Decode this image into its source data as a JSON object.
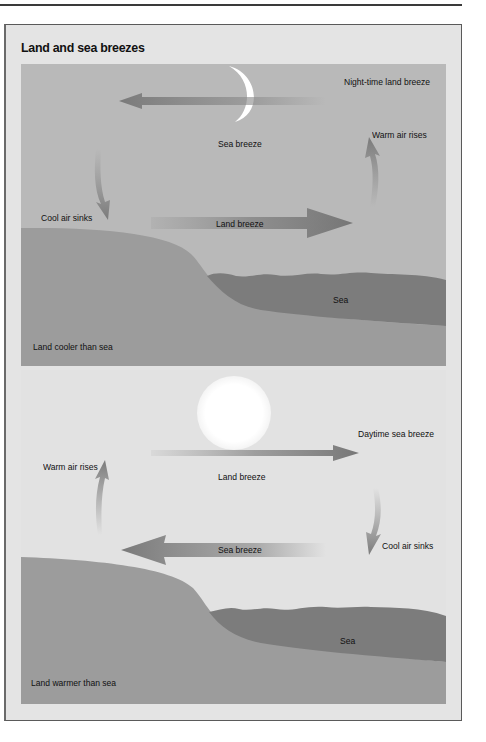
{
  "figure": {
    "title": "Land and sea breezes"
  },
  "night_panel": {
    "caption": "Night-time land breeze",
    "celestial_icon": "crescent-moon-icon",
    "labels": {
      "upper_arrow": "Sea breeze",
      "lower_arrow": "Land breeze",
      "right_vertical": "Warm air rises",
      "left_vertical": "Cool air sinks",
      "sea": "Sea",
      "land": "Land cooler than sea"
    }
  },
  "day_panel": {
    "caption": "Daytime sea breeze",
    "celestial_icon": "sun-icon",
    "labels": {
      "upper_arrow": "Land breeze",
      "lower_arrow": "Sea breeze",
      "left_vertical": "Warm air rises",
      "right_vertical": "Cool air sinks",
      "sea": "Sea",
      "land": "Land warmer than sea"
    }
  },
  "colors": {
    "frame_bg": "#e4e4e4",
    "night_sky": "#b9b9b9",
    "day_sky": "#e2e2e2",
    "land": "#9c9c9c",
    "sea": "#7a7a7a",
    "arrow": "#7e7e7e"
  }
}
